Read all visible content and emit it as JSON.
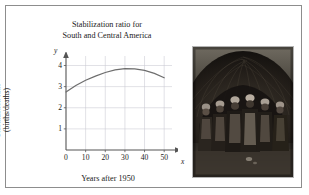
{
  "figure": {
    "background_color": "#ffffff",
    "frame_color": "#8d8d8d"
  },
  "chart_data": {
    "type": "line",
    "title_line1": "Stabilization ratio for",
    "title_line2": "South and Central America",
    "xlabel": "Years after 1950",
    "ylabel_line1": "Stabilization ratio",
    "ylabel_line2": "(births/deaths)",
    "x_axis_variable": "x",
    "y_axis_variable": "y",
    "xlim": [
      0,
      55
    ],
    "ylim": [
      0,
      4.45
    ],
    "xticks": [
      0,
      10,
      20,
      30,
      40,
      50
    ],
    "yticks": [
      1,
      2,
      3,
      4
    ],
    "grid": true,
    "grid_color": "#c8c8d2",
    "axis_color": "#555555",
    "legend": "none",
    "series": [
      {
        "name": "Stabilization ratio",
        "color": "#6e6e6e",
        "x": [
          0,
          5,
          10,
          15,
          20,
          25,
          30,
          35,
          40,
          45,
          50
        ],
        "values": [
          2.75,
          3.05,
          3.3,
          3.5,
          3.67,
          3.79,
          3.85,
          3.84,
          3.77,
          3.63,
          3.42
        ]
      }
    ]
  },
  "photo": {
    "caption": "group of people standing in front of a thatched dwelling",
    "border_color": "#b4b4b4"
  }
}
